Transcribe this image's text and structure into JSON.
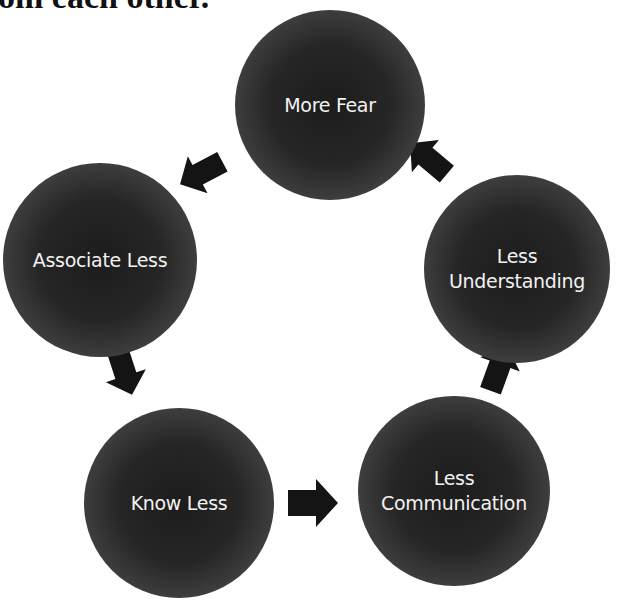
{
  "header": {
    "partial_text": "om each other."
  },
  "cycle": {
    "nodes": [
      {
        "id": "more-fear",
        "lines": [
          "More Fear"
        ]
      },
      {
        "id": "associate-less",
        "lines": [
          "Associate Less"
        ]
      },
      {
        "id": "know-less",
        "lines": [
          "Know Less"
        ]
      },
      {
        "id": "less-communication",
        "lines": [
          "Less",
          "Communication"
        ]
      },
      {
        "id": "less-understanding",
        "lines": [
          "Less",
          "Understanding"
        ]
      }
    ],
    "arrows": [
      {
        "from": "more-fear",
        "to": "associate-less",
        "direction": "down-left"
      },
      {
        "from": "associate-less",
        "to": "know-less",
        "direction": "down"
      },
      {
        "from": "know-less",
        "to": "less-communication",
        "direction": "right"
      },
      {
        "from": "less-communication",
        "to": "less-understanding",
        "direction": "up"
      },
      {
        "from": "less-understanding",
        "to": "more-fear",
        "direction": "up-left"
      }
    ],
    "colors": {
      "node": "#262626",
      "arrow": "#141414",
      "text": "#f2f2f2"
    }
  }
}
